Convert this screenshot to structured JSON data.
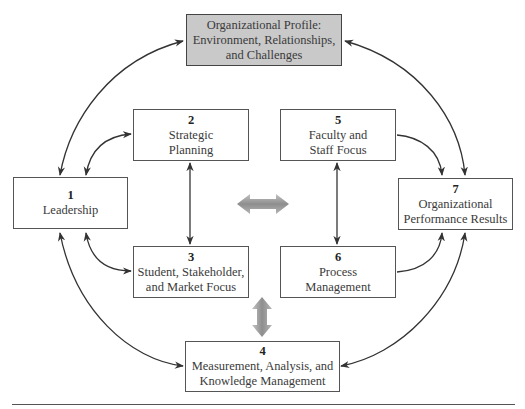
{
  "diagram": {
    "profile": {
      "label": "Organizational Profile:\nEnvironment, Relationships,\nand Challenges"
    },
    "boxes": [
      {
        "id": 1,
        "number": "1",
        "label": "Leadership"
      },
      {
        "id": 2,
        "number": "2",
        "label": "Strategic\nPlanning"
      },
      {
        "id": 3,
        "number": "3",
        "label": "Student, Stakeholder,\nand Market Focus"
      },
      {
        "id": 4,
        "number": "4",
        "label": "Measurement, Analysis, and\nKnowledge Management"
      },
      {
        "id": 5,
        "number": "5",
        "label": "Faculty and\nStaff Focus"
      },
      {
        "id": 6,
        "number": "6",
        "label": "Process\nManagement"
      },
      {
        "id": 7,
        "number": "7",
        "label": "Organizational\nPerformance Results"
      }
    ],
    "connections": [
      {
        "from": "profile",
        "to": "1",
        "type": "bidirectional"
      },
      {
        "from": "profile",
        "to": "7",
        "type": "bidirectional"
      },
      {
        "from": "1",
        "to": "2",
        "type": "bidirectional"
      },
      {
        "from": "1",
        "to": "3",
        "type": "bidirectional"
      },
      {
        "from": "1",
        "to": "4",
        "type": "bidirectional"
      },
      {
        "from": "2",
        "to": "3",
        "type": "bidirectional"
      },
      {
        "from": "5",
        "to": "6",
        "type": "bidirectional"
      },
      {
        "from": "5",
        "to": "7",
        "type": "directed"
      },
      {
        "from": "6",
        "to": "7",
        "type": "directed"
      },
      {
        "from": "7",
        "to": "4",
        "type": "bidirectional"
      },
      {
        "from": "left-group",
        "to": "right-group",
        "type": "bidirectional-wide"
      },
      {
        "from": "3",
        "to": "4",
        "type": "bidirectional-wide"
      }
    ],
    "colors": {
      "profile_fill": "#c9c9c9",
      "line": "#333333",
      "wide_arrow": "#9a9a9a"
    }
  }
}
